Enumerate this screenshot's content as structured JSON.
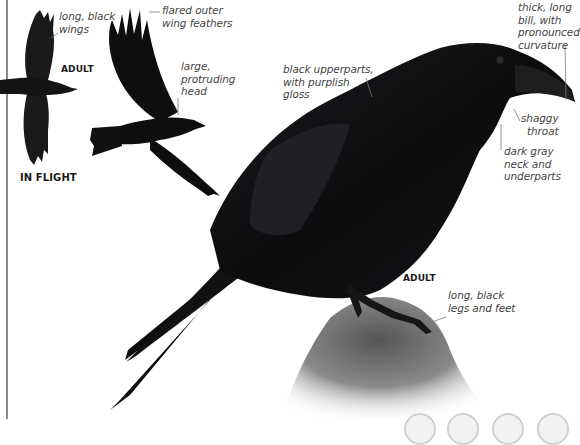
{
  "species_page": {
    "subject": "Common Raven",
    "flight_panel": {
      "section_label": "IN FLIGHT",
      "age_label": "ADULT",
      "annotations": [
        {
          "id": "wings",
          "text": "long, black\nwings"
        },
        {
          "id": "flared",
          "text": "flared outer\nwing feathers"
        },
        {
          "id": "head",
          "text": "large,\nprotruding\nhead"
        }
      ]
    },
    "perched_panel": {
      "age_label": "ADULT",
      "annotations": [
        {
          "id": "upperparts",
          "text": "black upperparts,\nwith purplish\ngloss"
        },
        {
          "id": "bill",
          "text": "thick, long\nbill, with\npronounced\ncurvature"
        },
        {
          "id": "throat",
          "text": "shaggy\nthroat"
        },
        {
          "id": "neck",
          "text": "dark gray\nneck and\nunderparts"
        },
        {
          "id": "legs",
          "text": "long, black\nlegs and feet"
        }
      ]
    },
    "pager": {
      "dots": [
        {
          "x": 404
        },
        {
          "x": 447
        },
        {
          "x": 492
        },
        {
          "x": 537
        }
      ]
    },
    "colors": {
      "plumage": "#101012",
      "gloss": "#3a3840",
      "rock": "#6f6f6f",
      "leader_line": "#7a7a7a",
      "text": "#444444",
      "rule": "#8a8a8a"
    }
  }
}
